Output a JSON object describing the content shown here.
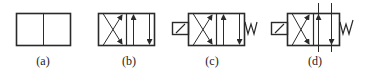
{
  "diagram": {
    "stroke_color": "#2a2a2a",
    "figures": [
      {
        "id": "a",
        "label": "(a)",
        "description": "two-position valve body, two empty cells"
      },
      {
        "id": "b",
        "label": "(b)",
        "description": "two-position valve with crossed flow paths (left) and parallel flow paths (right)"
      },
      {
        "id": "c",
        "label": "(c)",
        "description": "solenoid-actuated, spring-return two-position valve"
      },
      {
        "id": "d",
        "label": "(d)",
        "description": "solenoid-actuated, spring-return two-position valve with external port lines connected"
      }
    ]
  }
}
